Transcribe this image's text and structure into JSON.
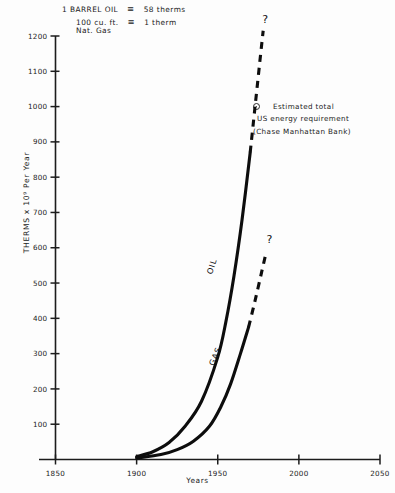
{
  "chart_data": {
    "type": "line",
    "title": "",
    "xlabel": "Years",
    "ylabel": "THERMS x 10⁹ Per Year",
    "xlim": [
      1850,
      2050
    ],
    "ylim": [
      0,
      1200
    ],
    "grid": false,
    "legend_position": "inline-curve-labels",
    "xticks": [
      "1850",
      "1900",
      "1950",
      "2000",
      "2050"
    ],
    "xtick_values": [
      1850,
      1900,
      1950,
      2000,
      2050
    ],
    "yticks": [
      "100",
      "200",
      "300",
      "400",
      "500",
      "600",
      "700",
      "800",
      "900",
      "1000",
      "1100",
      "1200"
    ],
    "ytick_values": [
      100,
      200,
      300,
      400,
      500,
      600,
      700,
      800,
      900,
      1000,
      1100,
      1200
    ],
    "series": [
      {
        "name": "OIL",
        "style": "solid-then-dashed",
        "solid_points": [
          {
            "x": 1900,
            "y": 8
          },
          {
            "x": 1910,
            "y": 22
          },
          {
            "x": 1920,
            "y": 48
          },
          {
            "x": 1930,
            "y": 95
          },
          {
            "x": 1940,
            "y": 165
          },
          {
            "x": 1950,
            "y": 290
          },
          {
            "x": 1955,
            "y": 390
          },
          {
            "x": 1960,
            "y": 520
          },
          {
            "x": 1965,
            "y": 680
          },
          {
            "x": 1970,
            "y": 870
          }
        ],
        "dashed_points": [
          {
            "x": 1970,
            "y": 870
          },
          {
            "x": 1973,
            "y": 1000
          },
          {
            "x": 1976,
            "y": 1130
          },
          {
            "x": 1978,
            "y": 1215
          }
        ],
        "end_marker": "?"
      },
      {
        "name": "GAS",
        "style": "solid-then-dashed",
        "solid_points": [
          {
            "x": 1900,
            "y": 4
          },
          {
            "x": 1915,
            "y": 14
          },
          {
            "x": 1925,
            "y": 28
          },
          {
            "x": 1935,
            "y": 52
          },
          {
            "x": 1945,
            "y": 95
          },
          {
            "x": 1952,
            "y": 150
          },
          {
            "x": 1958,
            "y": 215
          },
          {
            "x": 1964,
            "y": 300
          },
          {
            "x": 1969,
            "y": 375
          }
        ],
        "dashed_points": [
          {
            "x": 1969,
            "y": 375
          },
          {
            "x": 1973,
            "y": 450
          },
          {
            "x": 1977,
            "y": 530
          },
          {
            "x": 1980,
            "y": 590
          }
        ],
        "end_marker": "?"
      }
    ],
    "annotations": [
      {
        "marker": "circle-dot",
        "lines": [
          "Estimated  total",
          "US  energy  requirement",
          "(Chase Manhattan Bank)"
        ]
      }
    ],
    "conversion_notes": [
      {
        "quantity": "1  BARREL  OIL",
        "equals_symbol": "≡",
        "value": "58   therms"
      },
      {
        "quantity_line1": "100  cu. ft.",
        "quantity_line2": "Nat.  Gas",
        "equals_symbol": "≡",
        "value": "1   therm"
      }
    ]
  },
  "curve_labels": {
    "oil": "OIL",
    "gas": "GAS"
  },
  "question_marks": {
    "oil": "?",
    "gas": "?"
  }
}
